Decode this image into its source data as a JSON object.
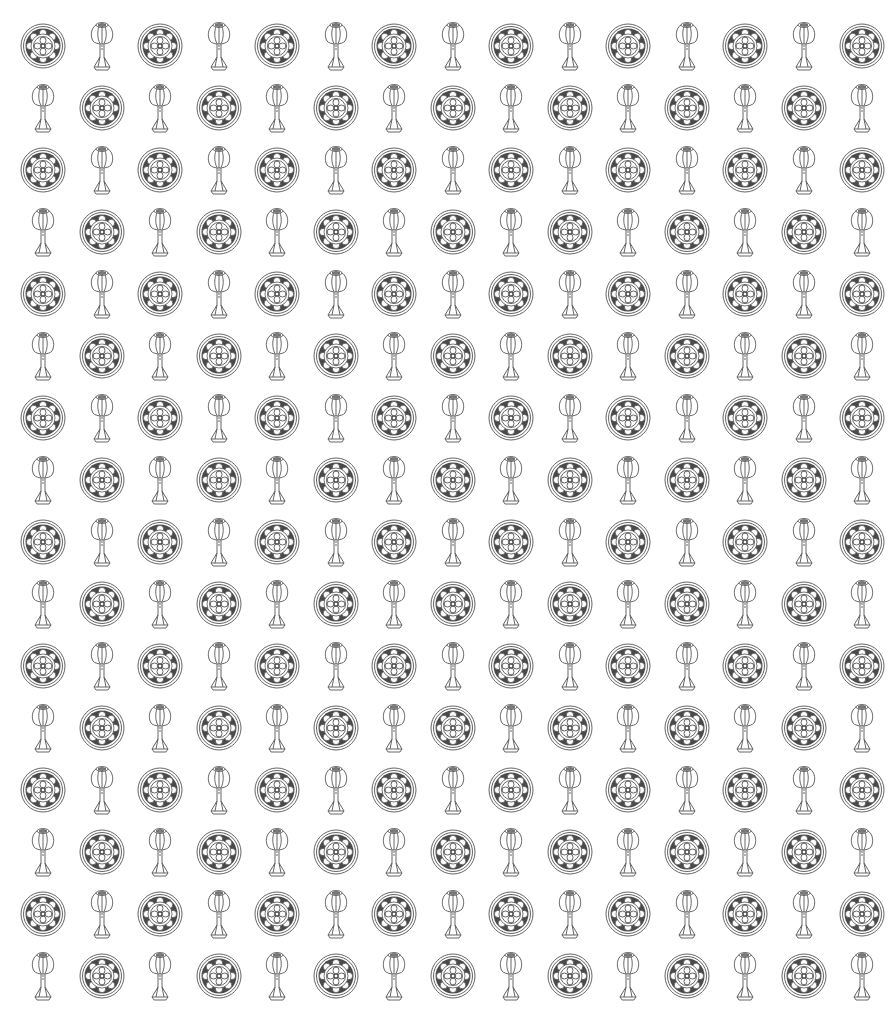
{
  "pattern": {
    "rows": 16,
    "cols": 15,
    "origin_x": 43,
    "origin_y": 46,
    "pitch_x": 58.5,
    "pitch_y": 62,
    "motifs": [
      "medallion-icon",
      "lotus-lamp-icon"
    ],
    "colors": {
      "line": "#555555",
      "fill_dark": "#4a4a4a",
      "background": "#ffffff"
    }
  }
}
